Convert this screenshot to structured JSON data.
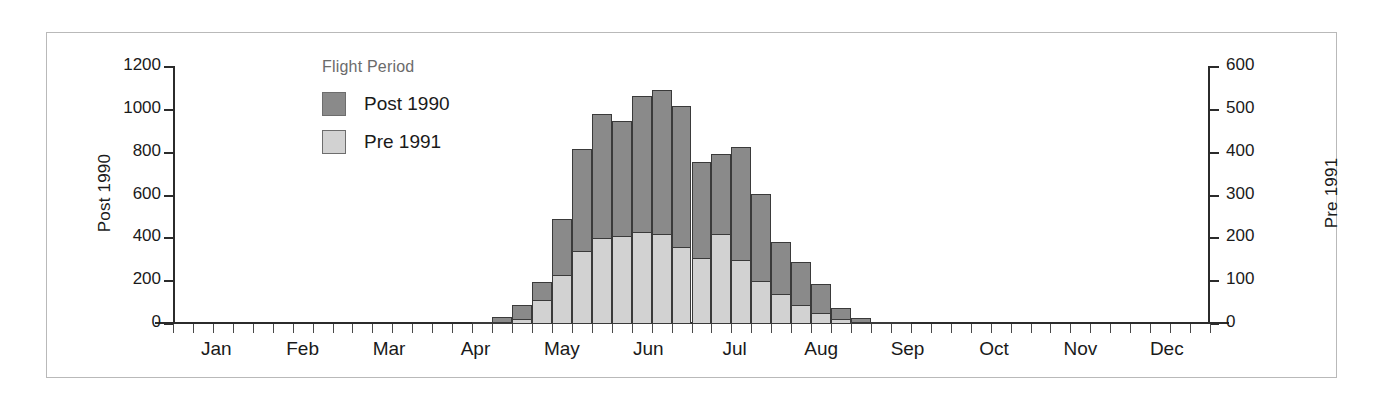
{
  "chart_data": {
    "type": "bar",
    "title": "",
    "subtitle": "",
    "stacked": true,
    "grid": false,
    "legend": {
      "title": "Flight Period",
      "position": "top-left",
      "entries": [
        {
          "name": "Post 1990",
          "color": "#8a8a8a"
        },
        {
          "name": "Pre 1991",
          "color": "#d2d2d2"
        }
      ]
    },
    "xlabel": "",
    "ylabel": "Post 1990",
    "y2label": "Pre 1991",
    "ylim": [
      0,
      1200
    ],
    "y2lim": [
      0,
      600
    ],
    "yticks": [
      0,
      200,
      400,
      600,
      800,
      1000,
      1200
    ],
    "y2ticks": [
      0,
      100,
      200,
      300,
      400,
      500,
      600
    ],
    "xticklabels": [
      "Jan",
      "Feb",
      "Mar",
      "Apr",
      "May",
      "Jun",
      "Jul",
      "Aug",
      "Sep",
      "Oct",
      "Nov",
      "Dec"
    ],
    "x_tick_interval": "weekly",
    "n_bins": 52,
    "categories": [
      "w1",
      "w2",
      "w3",
      "w4",
      "w5",
      "w6",
      "w7",
      "w8",
      "w9",
      "w10",
      "w11",
      "w12",
      "w13",
      "w14",
      "w15",
      "w16",
      "w17",
      "w18",
      "w19",
      "w20",
      "w21",
      "w22",
      "w23",
      "w24",
      "w25",
      "w26",
      "w27",
      "w28",
      "w29",
      "w30",
      "w31",
      "w32",
      "w33",
      "w34",
      "w35",
      "w36",
      "w37",
      "w38",
      "w39",
      "w40",
      "w41",
      "w42",
      "w43",
      "w44",
      "w45",
      "w46",
      "w47",
      "w48",
      "w49",
      "w50",
      "w51",
      "w52"
    ],
    "series": [
      {
        "name": "Post 1990",
        "axis": "left",
        "color": "#8a8a8a",
        "values": [
          0,
          0,
          0,
          0,
          0,
          0,
          0,
          0,
          0,
          0,
          0,
          0,
          0,
          0,
          0,
          5,
          35,
          90,
          195,
          490,
          815,
          980,
          950,
          1065,
          1095,
          1020,
          755,
          795,
          825,
          605,
          385,
          290,
          185,
          75,
          30,
          8,
          3,
          0,
          0,
          0,
          0,
          0,
          0,
          0,
          0,
          0,
          0,
          0,
          0,
          0,
          0,
          0
        ]
      },
      {
        "name": "Pre 1991",
        "axis": "right",
        "color": "#d2d2d2",
        "values": [
          0,
          0,
          0,
          0,
          0,
          0,
          0,
          0,
          0,
          0,
          0,
          0,
          0,
          0,
          0,
          0,
          3,
          12,
          55,
          115,
          170,
          200,
          205,
          215,
          210,
          180,
          155,
          210,
          150,
          100,
          70,
          45,
          25,
          12,
          5,
          2,
          0,
          0,
          0,
          0,
          0,
          0,
          0,
          0,
          0,
          0,
          0,
          0,
          0,
          0,
          0,
          0
        ]
      }
    ]
  }
}
